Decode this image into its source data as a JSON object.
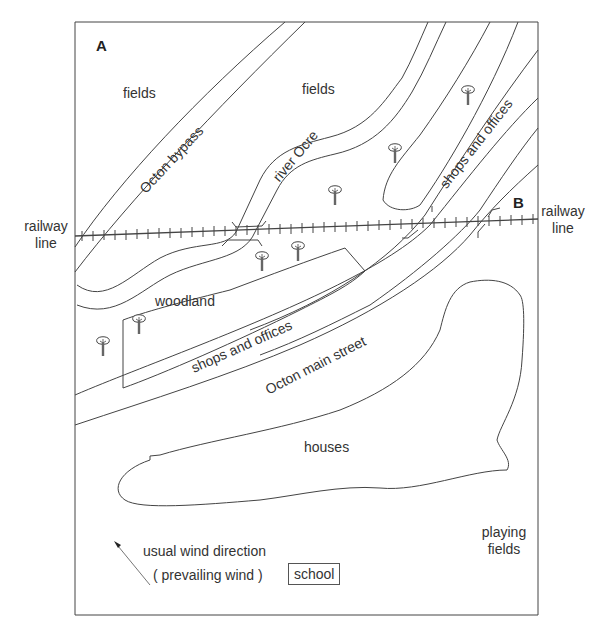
{
  "map": {
    "corner_labels": {
      "a": "A",
      "b": "B"
    },
    "railway": {
      "left_label": "railway\nline",
      "right_label": "railway\nline",
      "left_line1": "railway",
      "left_line2": "line",
      "right_line1": "railway",
      "right_line2": "line"
    },
    "areas": {
      "fields_left": "fields",
      "fields_right": "fields",
      "woodland": "woodland",
      "houses": "houses",
      "playing_fields_line1": "playing",
      "playing_fields_line2": "fields",
      "school": "school"
    },
    "roads": {
      "bypass": "Octon bypass",
      "main_street": "Octon main street"
    },
    "river": "river Ocre",
    "shops_upper": "shops and offices",
    "shops_lower": "shops and offices",
    "wind": {
      "line1": "usual wind direction",
      "line2": "( prevailing wind )"
    },
    "icons": {
      "tree": "tree-icon",
      "wind_arrow": "arrow-icon"
    },
    "colors": {
      "line": "#444444",
      "text": "#333333",
      "background": "#ffffff"
    }
  }
}
